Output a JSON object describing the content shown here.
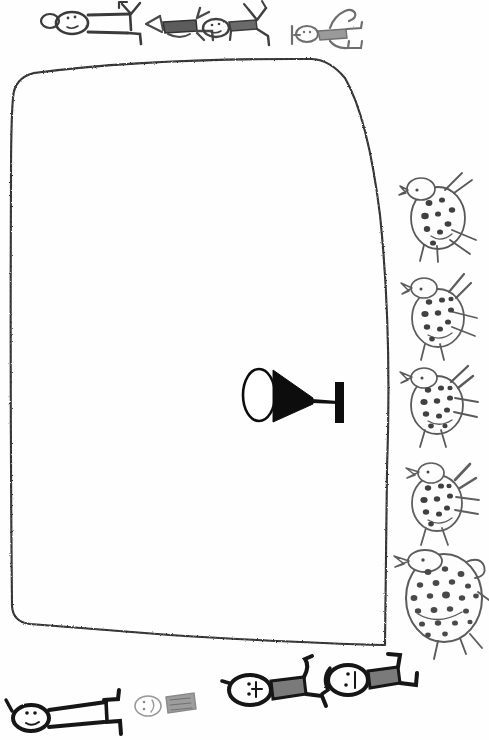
{
  "artwork": {
    "title": "Child's pencil drawing: animal pen with spotted animals and stick figures",
    "medium": "pencil and marker on white paper",
    "paper_color": "#fefefe",
    "ink_dark": "#1a1a1a",
    "ink_grey": "#7d7d7d",
    "ink_light": "#a8a8a8",
    "width": 489,
    "height": 740
  },
  "elements": {
    "enclosure": {
      "label": "large rounded rectangular pen outline",
      "stroke_color": "#2b2b2b",
      "style": "rough sketchy single line",
      "corners": "rounded"
    },
    "center_object": {
      "label": "tool with oval head, black cone and T-handle",
      "oval_label": "oval outline",
      "cone_label": "solid black cone",
      "handle_label": "T-shaped handle",
      "fill_color": "#101010"
    },
    "animals": [
      {
        "name": "spotted-animal-1",
        "spots": 9,
        "size": "small",
        "note": "top of right column"
      },
      {
        "name": "spotted-animal-2",
        "spots": 10,
        "size": "small",
        "note": "second from top"
      },
      {
        "name": "spotted-animal-3",
        "spots": 11,
        "size": "small",
        "note": "middle"
      },
      {
        "name": "spotted-animal-4",
        "spots": 10,
        "size": "small",
        "note": "fourth"
      },
      {
        "name": "spotted-animal-5",
        "spots": 22,
        "size": "large",
        "note": "bottom, largest, overlaps pen corner"
      }
    ],
    "figures_top": [
      {
        "name": "stick-figure-top-1",
        "weight": "medium",
        "has_face": true,
        "torso_shading": "none"
      },
      {
        "name": "stick-figure-top-2",
        "weight": "medium",
        "has_face": false,
        "torso_shading": "dark grey"
      },
      {
        "name": "stick-figure-top-3",
        "weight": "medium",
        "has_face": true,
        "torso_shading": "dark grey"
      },
      {
        "name": "stick-figure-top-4",
        "weight": "light",
        "has_face": true,
        "torso_shading": "light grey"
      }
    ],
    "figures_bottom": [
      {
        "name": "stick-figure-bottom-1",
        "weight": "bold",
        "has_face": true,
        "torso_shading": "none",
        "note": "bottom left, cropped by edge"
      },
      {
        "name": "stick-figure-bottom-2",
        "weight": "light",
        "has_face": true,
        "torso_shading": "grey",
        "note": "faint, centre-left"
      },
      {
        "name": "stick-figure-bottom-3",
        "weight": "bold",
        "has_face": true,
        "torso_shading": "grey",
        "note": "centre"
      },
      {
        "name": "stick-figure-bottom-4",
        "weight": "bold",
        "has_face": true,
        "torso_shading": "grey",
        "note": "right of centre"
      }
    ]
  },
  "counts": {
    "animals_total": 5,
    "figures_total": 8
  }
}
